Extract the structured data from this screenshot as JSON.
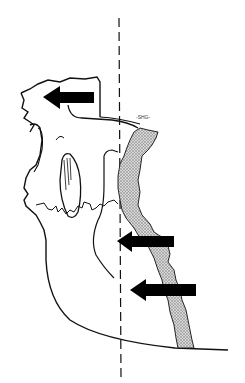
{
  "figure": {
    "type": "anatomical line drawing",
    "signature": "-SHG-",
    "arrows": [
      {
        "id": "arrow-maxilla",
        "direction": "left"
      },
      {
        "id": "arrow-ramus-upper",
        "direction": "left"
      },
      {
        "id": "arrow-ramus-lower",
        "direction": "left"
      }
    ],
    "reference_line": "vertical dashed line",
    "colors": {
      "line": "#111111",
      "arrow": "#000000",
      "shaded_region": "#bbbbbb",
      "background": "#ffffff"
    }
  }
}
